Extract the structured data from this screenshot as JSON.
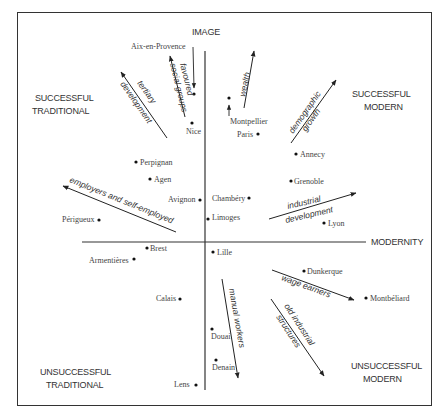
{
  "axes": {
    "vertical": {
      "label": "IMAGE"
    },
    "horizontal": {
      "label": "MODERNITY"
    }
  },
  "quadrants": {
    "top_left": {
      "line1": "SUCCESSFUL",
      "line2": "TRADITIONAL"
    },
    "top_right": {
      "line1": "SUCCESSFUL",
      "line2": "MODERN"
    },
    "bottom_left": {
      "line1": "UNSUCCESSFUL",
      "line2": "TRADITIONAL"
    },
    "bottom_right": {
      "line1": "UNSUCCESSFUL",
      "line2": "MODERN"
    }
  },
  "cities": [
    {
      "name": "Aix-en-Provence"
    },
    {
      "name": "Nice"
    },
    {
      "name": "Montpellier"
    },
    {
      "name": "Paris"
    },
    {
      "name": "Annecy"
    },
    {
      "name": "Perpignan"
    },
    {
      "name": "Agen"
    },
    {
      "name": "Grenoble"
    },
    {
      "name": "Avignon"
    },
    {
      "name": "Chambéry"
    },
    {
      "name": "Limoges"
    },
    {
      "name": "Lyon"
    },
    {
      "name": "Périgueux"
    },
    {
      "name": "Brest"
    },
    {
      "name": "Armentières"
    },
    {
      "name": "Lille"
    },
    {
      "name": "Dunkerque"
    },
    {
      "name": "Montbéliard"
    },
    {
      "name": "Calais"
    },
    {
      "name": "Douai"
    },
    {
      "name": "Denain"
    },
    {
      "name": "Lens"
    }
  ],
  "factors": {
    "tertiary": {
      "line1": "tertiary",
      "line2": "development"
    },
    "favoured": {
      "line1": "favoured",
      "line2": "social groups"
    },
    "wealth": {
      "line1": "wealth"
    },
    "demographic": {
      "line1": "demographic",
      "line2": "growth"
    },
    "employers": {
      "line1": "employers and self-employed"
    },
    "industrial": {
      "line1": "industrial",
      "line2": "development"
    },
    "wage": {
      "line1": "wage earners"
    },
    "manual": {
      "line1": "manual workers"
    },
    "old_industrial": {
      "line1": "old industrial",
      "line2": "structures"
    }
  }
}
